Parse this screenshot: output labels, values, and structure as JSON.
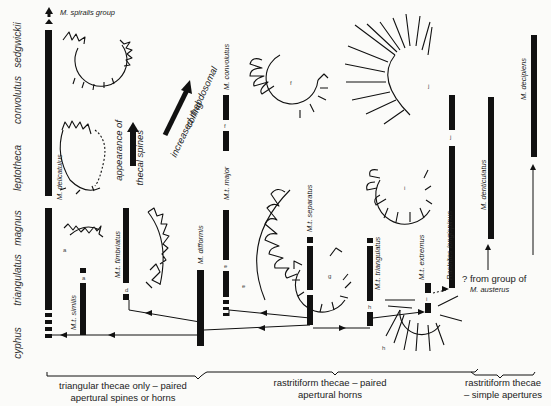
{
  "zones": [
    {
      "id": "sedgwickii",
      "label": "sedgwickii"
    },
    {
      "id": "convolutus",
      "label": "convolutus"
    },
    {
      "id": "leptotheca",
      "label": "leptotheca"
    },
    {
      "id": "magnus",
      "label": "magnus"
    },
    {
      "id": "triangulatus",
      "label": "triangulatus"
    },
    {
      "id": "cyphus",
      "label": "cyphus"
    }
  ],
  "taxa": {
    "spiralis_group": "M. spiralis group",
    "delicatulus": "M. delicatulus",
    "similis": "M.t. similis",
    "fimbriatus": "M.t. fimbriatus",
    "difformis": "M. difformis",
    "major": "M.t. major",
    "convolutus": "M. convolutus",
    "separatus": "M.t. separatus",
    "triangulatus": "M.t. triangulatus",
    "extremus": "M.t. extremus",
    "longispinus": "Rastrites longispinus",
    "denticulatus": "M. denticulatus",
    "decipiens": "M. decipiens"
  },
  "annotations": {
    "thecal_spines_1": "appearance of",
    "thecal_spines_2": "thecal spines",
    "coiling_1": "increased rhabdosomal",
    "coiling_2": "coiling",
    "austerus_1": "? from group of",
    "austerus_2": "M. austerus"
  },
  "figure_labels": {
    "a1": "a",
    "a2": "a",
    "d": "d",
    "e1": "e",
    "e2": "e",
    "f1": "f",
    "f2": "f",
    "g": "g",
    "h1": "h",
    "h2": "h",
    "i1": "i",
    "i2": "i",
    "j1": "j",
    "j2": "j"
  },
  "groups": [
    {
      "line1": "triangular thecae only – paired",
      "line2": "apertural spines or horns"
    },
    {
      "line1": "rastritiform thecae – paired",
      "line2": "apertural horns"
    },
    {
      "line1": "rastritiform thecae",
      "line2": "– simple apertures"
    }
  ]
}
